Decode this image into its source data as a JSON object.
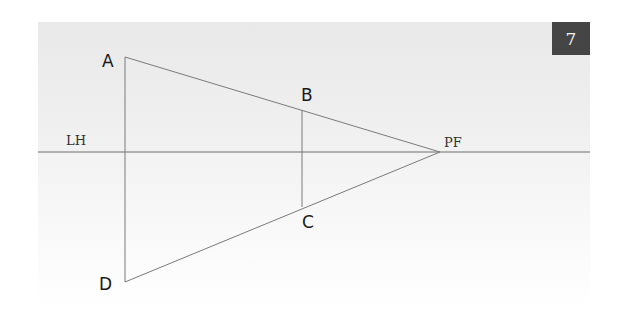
{
  "figure": {
    "page_number": "7",
    "colors": {
      "badge_bg": "#454545",
      "badge_text": "#f2f2f2",
      "line": "#6e6e6e",
      "panel_top": "#e9e9e9",
      "panel_bottom": "#ffffff"
    },
    "labels": {
      "horizon": "LH",
      "vanishing_point": "PF",
      "a": "A",
      "b": "B",
      "c": "C",
      "d": "D"
    },
    "points": {
      "A": [
        125,
        57
      ],
      "B": [
        302,
        110
      ],
      "C": [
        302,
        207
      ],
      "D": [
        125,
        282
      ],
      "PF": [
        440,
        152
      ]
    },
    "horizon_line": {
      "y": 152,
      "x1": 38,
      "x2": 590
    }
  }
}
